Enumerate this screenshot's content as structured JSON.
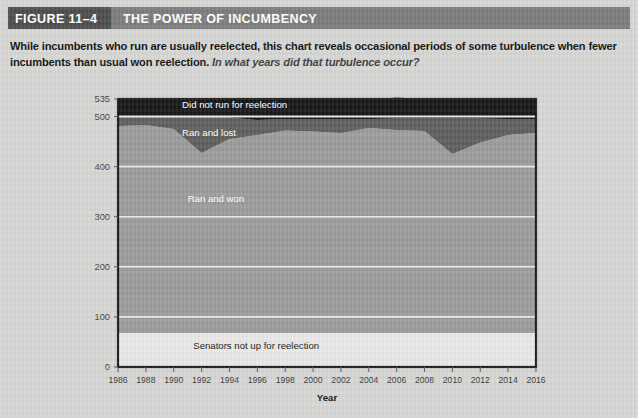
{
  "figure": {
    "number_label": "FIGURE 11–4",
    "title": "THE POWER OF INCUMBENCY",
    "caption_main": "While incumbents who run are usually reelected, this chart reveals occasional periods of some turbulence when fewer incumbents than usual won reelection.",
    "caption_question": "In what years did that turbulence occur?"
  },
  "colors": {
    "page_background": "#d6d7d5",
    "header_number_bg": "#4c4c4c",
    "header_title_bg": "#7b7c7b",
    "header_text": "#ffffff",
    "plot_border": "#1c1c1c",
    "band_not_up": "#e8e8e6",
    "band_ran_won": "#9b9b9b",
    "band_ran_lost": "#5e5e5e",
    "band_did_not_run": "#17171a",
    "gridline": "#f2f2f0",
    "axis_text": "#3a3a3a"
  },
  "chart_data": {
    "type": "area",
    "stacked": true,
    "title": "THE POWER OF INCUMBENCY",
    "xlabel": "Year",
    "ylabel": "",
    "xlim": [
      1986,
      2016
    ],
    "ylim": [
      0,
      535
    ],
    "grid": true,
    "legend_position": "inline-labels",
    "x": [
      1986,
      1988,
      1990,
      1992,
      1994,
      1996,
      1998,
      2000,
      2002,
      2004,
      2006,
      2008,
      2010,
      2012,
      2014,
      2016
    ],
    "xtick_labels": [
      "1986",
      "1988",
      "1990",
      "1992",
      "1994",
      "1996",
      "1998",
      "2000",
      "2002",
      "2004",
      "2006",
      "2008",
      "2010",
      "2012",
      "2014",
      "2016"
    ],
    "ytick_values": [
      0,
      100,
      200,
      300,
      400,
      500,
      535
    ],
    "ytick_labels": [
      "0",
      "100",
      "200",
      "300",
      "400",
      "500",
      "535"
    ],
    "series": [
      {
        "name": "Senators not up for reelection",
        "color": "#e8e8e6",
        "label_color": "dark",
        "values": [
          68,
          68,
          68,
          68,
          68,
          68,
          68,
          68,
          68,
          68,
          68,
          68,
          68,
          68,
          68,
          68
        ]
      },
      {
        "name": "Ran and won",
        "color": "#9b9b9b",
        "label_color": "light",
        "values": [
          413,
          415,
          407,
          359,
          387,
          395,
          404,
          402,
          399,
          409,
          405,
          403,
          357,
          380,
          395,
          399
        ]
      },
      {
        "name": "Ran and lost",
        "color": "#5e5e5e",
        "label_color": "light",
        "values": [
          20,
          17,
          26,
          72,
          43,
          30,
          23,
          25,
          28,
          18,
          23,
          25,
          71,
          48,
          32,
          27
        ]
      },
      {
        "name": "Did not run for reelection",
        "color": "#17171a",
        "label_color": "light",
        "values": [
          34,
          35,
          34,
          36,
          37,
          42,
          40,
          40,
          38,
          39,
          42,
          39,
          39,
          37,
          40,
          41
        ]
      }
    ],
    "annotations": [
      {
        "text": "Did not run for reelection",
        "x": 1990.6,
        "y": 518
      },
      {
        "text": "Ran and lost",
        "x": 1990.6,
        "y": 462
      },
      {
        "text": "Ran and won",
        "x": 1991.0,
        "y": 330
      },
      {
        "text": "Senators not up for reelection",
        "x": 1991.4,
        "y": 35
      }
    ]
  }
}
